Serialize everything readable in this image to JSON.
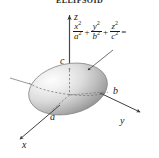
{
  "figure": {
    "title": "ELLIPSOID",
    "type": "quadric-surface-diagram",
    "caption_equation": "x^2/a^2 + y^2/b^2 + z^2/c^2 =",
    "equation": {
      "term1": {
        "numerator_var": "x",
        "numerator_exp": "2",
        "denominator_var": "a",
        "denominator_exp": "2"
      },
      "op1": "+",
      "term2": {
        "numerator_var": "y",
        "numerator_exp": "2",
        "denominator_var": "b",
        "denominator_exp": "2"
      },
      "op2": "+",
      "term3": {
        "numerator_var": "z",
        "numerator_exp": "2",
        "denominator_var": "c",
        "denominator_exp": "2"
      },
      "equals": "="
    },
    "axes": [
      {
        "name": "z-axis",
        "label": "z",
        "direction": "up"
      },
      {
        "name": "y-axis",
        "label": "y",
        "direction": "lower-right"
      },
      {
        "name": "x-axis",
        "label": "x",
        "direction": "lower-left"
      }
    ],
    "intercept_labels": [
      {
        "name": "semi-axis-c",
        "label": "c",
        "axis": "z"
      },
      {
        "name": "semi-axis-b",
        "label": "b",
        "axis": "y"
      },
      {
        "name": "semi-axis-a",
        "label": "a",
        "axis": "x"
      }
    ],
    "colors": {
      "surface_highlight": "#fbfbfb",
      "surface_mid": "#d2d2d2",
      "surface_shadow": "#8e8e8e",
      "outline": "#6e6e6e",
      "axis": "#3a3a3a",
      "dashed_trace": "#707070",
      "text": "#1a1a1a"
    }
  }
}
